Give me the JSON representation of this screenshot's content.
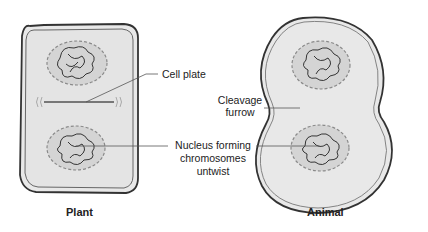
{
  "diagram": {
    "type": "cytokinesis comparison",
    "panels": [
      {
        "id": "plant",
        "caption": "Plant"
      },
      {
        "id": "animal",
        "caption": "Animal"
      }
    ],
    "labels": {
      "cell_plate": "Cell plate",
      "cleavage_furrow_line1": "Cleavage",
      "cleavage_furrow_line2": "furrow",
      "nucleus_line1": "Nucleus forming",
      "nucleus_line2": "chromosomes",
      "nucleus_line3": "untwist"
    },
    "colors": {
      "cell_fill": "#e6e6e6",
      "wall_outline": "#333333",
      "nucleus_fill": "#d2d2d2",
      "nuclear_envelope_dashed": "#8a8a8a",
      "chromosome_stroke": "#222222",
      "leader_line": "#555555"
    }
  }
}
